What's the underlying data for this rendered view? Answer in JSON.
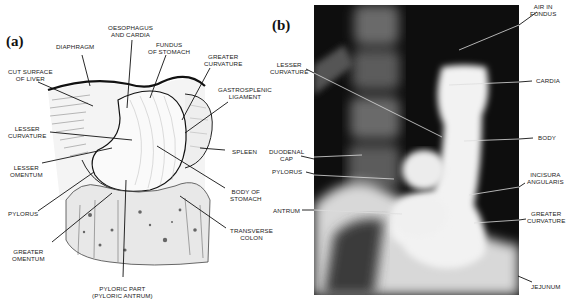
{
  "figure": {
    "panel_a": {
      "label": "(a)",
      "type": "anatomical line drawing of the stomach",
      "labels": {
        "oesophagus": "OESOPHAGUS\nAND CARDIA",
        "diaphragm": "DIAPHRAGM",
        "fundus": "FUNDUS\nOF STOMACH",
        "greater_curvature": "GREATER\nCURVATURE",
        "cut_surface_liver": "CUT SURFACE\nOF LIVER",
        "gastrosplenic": "GASTROSPLENIC\nLIGAMENT",
        "lesser_curvature": "LESSER\nCURVATURE",
        "spleen": "SPLEEN",
        "lesser_omentum": "LESSER\nOMENTUM",
        "body_of_stomach": "BODY OF\nSTOMACH",
        "pylorus": "PYLORUS",
        "transverse_colon": "TRANSVERSE\nCOLON",
        "greater_omentum": "GREATER\nOMENTUM",
        "pyloric_part": "PYLORIC PART\n(PYLORIC ANTRUM)"
      }
    },
    "panel_b": {
      "label": "(b)",
      "type": "barium meal radiograph",
      "labels": {
        "air_in_fundus": "AIR IN\nFUNDUS",
        "lesser_curvature": "LESSER\nCURVATURE",
        "cardia": "CARDIA",
        "duodenal_cap": "DUODENAL\nCAP",
        "body": "BODY",
        "pylorus": "PYLORUS",
        "incisura": "INCISURA\nANGULARIS",
        "antrum": "ANTRUM",
        "greater_curvature": "GREATER\nCURVATURE",
        "jejunum": "JEJUNUM"
      }
    }
  }
}
